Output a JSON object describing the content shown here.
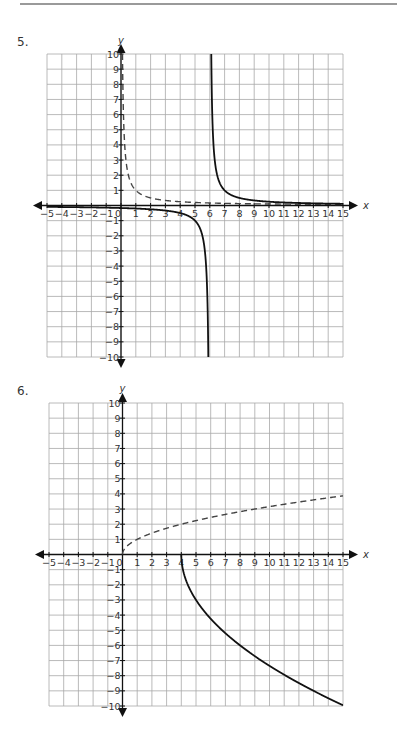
{
  "page": {
    "divider": true,
    "problems": [
      {
        "number": "5."
      },
      {
        "number": "6."
      }
    ]
  },
  "chart_data": [
    {
      "type": "line",
      "title": "5.",
      "xlabel": "x",
      "ylabel": "y",
      "xlim": [
        -5,
        15
      ],
      "ylim": [
        -10,
        10
      ],
      "grid": true,
      "x_ticks": [
        -5,
        -4,
        -3,
        -2,
        -1,
        0,
        1,
        2,
        3,
        4,
        5,
        6,
        7,
        8,
        9,
        10,
        11,
        12,
        13,
        14,
        15
      ],
      "y_ticks": [
        -10,
        -9,
        -8,
        -7,
        -6,
        -5,
        -4,
        -3,
        -2,
        -1,
        1,
        2,
        3,
        4,
        5,
        6,
        7,
        8,
        9,
        10
      ],
      "series": [
        {
          "name": "dashed",
          "style": "dashed",
          "equation": "y = 1/x",
          "fn": "recip",
          "shift": 0,
          "domain": [
            0.1,
            15
          ],
          "points": [
            [
              0.1,
              10
            ],
            [
              0.5,
              2
            ],
            [
              1,
              1
            ],
            [
              2,
              0.5
            ],
            [
              4,
              0.25
            ],
            [
              8,
              0.125
            ],
            [
              15,
              0.067
            ]
          ]
        },
        {
          "name": "solid-left",
          "style": "solid",
          "equation": "y = 1/(x-6)",
          "fn": "recip",
          "shift": 6,
          "domain": [
            -5,
            5.9
          ],
          "points": [
            [
              -5,
              -0.09
            ],
            [
              0,
              -0.17
            ],
            [
              3,
              -0.33
            ],
            [
              4,
              -0.5
            ],
            [
              5,
              -1
            ],
            [
              5.5,
              -2
            ],
            [
              5.9,
              -10
            ]
          ]
        },
        {
          "name": "solid-right",
          "style": "solid",
          "equation": "y = 1/(x-6)",
          "fn": "recip",
          "shift": 6,
          "domain": [
            6.1,
            15
          ],
          "points": [
            [
              6.1,
              10
            ],
            [
              6.5,
              2
            ],
            [
              7,
              1
            ],
            [
              8,
              0.5
            ],
            [
              10,
              0.25
            ],
            [
              15,
              0.11
            ]
          ]
        }
      ]
    },
    {
      "type": "line",
      "title": "6.",
      "xlabel": "x",
      "ylabel": "y",
      "xlim": [
        -5,
        15
      ],
      "ylim": [
        -10,
        10
      ],
      "grid": true,
      "x_ticks": [
        -5,
        -4,
        -3,
        -2,
        -1,
        0,
        1,
        2,
        3,
        4,
        5,
        6,
        7,
        8,
        9,
        10,
        11,
        12,
        13,
        14,
        15
      ],
      "y_ticks": [
        -10,
        -9,
        -8,
        -7,
        -6,
        -5,
        -4,
        -3,
        -2,
        -1,
        1,
        2,
        3,
        4,
        5,
        6,
        7,
        8,
        9,
        10
      ],
      "series": [
        {
          "name": "dashed",
          "style": "dashed",
          "equation": "y = sqrt(x)",
          "fn": "sqrt",
          "a": 1,
          "h": 0,
          "domain": [
            0,
            15
          ],
          "points": [
            [
              0,
              0
            ],
            [
              1,
              1
            ],
            [
              4,
              2
            ],
            [
              9,
              3
            ],
            [
              15,
              3.87
            ]
          ]
        },
        {
          "name": "solid",
          "style": "solid",
          "equation": "y = -3*sqrt(x-4)",
          "fn": "sqrt",
          "a": -3,
          "h": 4,
          "domain": [
            4,
            15
          ],
          "points": [
            [
              4,
              0
            ],
            [
              5,
              -3
            ],
            [
              8,
              -6
            ],
            [
              13,
              -9
            ],
            [
              15,
              -9.95
            ]
          ]
        }
      ]
    }
  ],
  "layout": [
    {
      "left": 47,
      "top": 54,
      "width": 296,
      "height": 303,
      "numX": 17,
      "numY": 47,
      "ylabelY": 41
    },
    {
      "left": 49,
      "top": 403,
      "width": 294,
      "height": 303,
      "numX": 17,
      "numY": 396,
      "ylabelY": 389
    }
  ]
}
